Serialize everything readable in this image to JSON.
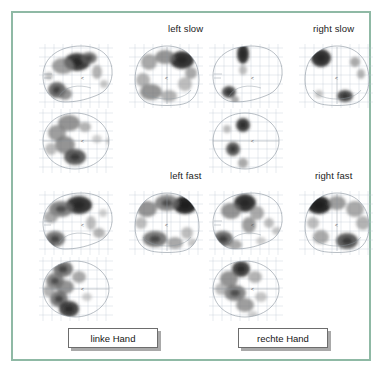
{
  "figure": {
    "border_color": "#8fb9a5",
    "background": "#ffffff",
    "caption_boxes": [
      {
        "name": "linke-hand",
        "label": "linke Hand"
      },
      {
        "name": "rechte-hand",
        "label": "rechte Hand"
      }
    ],
    "panel_titles": [
      {
        "name": "left-slow",
        "label": "left slow"
      },
      {
        "name": "right-slow",
        "label": "right slow"
      },
      {
        "name": "left-fast",
        "label": "left fast"
      },
      {
        "name": "right-fast",
        "label": "right fast"
      }
    ]
  },
  "chart_data": {
    "type": "heatmap",
    "title": "",
    "subtitle": "",
    "xlabel": "",
    "ylabel": "",
    "grid": true,
    "legend_position": "none",
    "colormap": "grayscale-inverted",
    "conditions": [
      {
        "name": "left slow",
        "hand": "linke Hand",
        "views": [
          "sagittal",
          "coronal",
          "transverse"
        ],
        "blob_density": "moderate",
        "peak_intensity": 0.95
      },
      {
        "name": "right slow",
        "hand": "rechte Hand",
        "views": [
          "sagittal",
          "coronal",
          "transverse"
        ],
        "blob_density": "sparse",
        "peak_intensity": 0.9
      },
      {
        "name": "left fast",
        "hand": "linke Hand",
        "views": [
          "sagittal",
          "coronal",
          "transverse"
        ],
        "blob_density": "high",
        "peak_intensity": 1.0
      },
      {
        "name": "right fast",
        "hand": "rechte Hand",
        "views": [
          "sagittal",
          "coronal",
          "transverse"
        ],
        "blob_density": "high",
        "peak_intensity": 1.0
      }
    ],
    "panels": [
      {
        "id": "left-slow-sagittal",
        "condition": "left slow",
        "view": "sagittal",
        "blobs": [
          {
            "cx": 42,
            "cy": 22,
            "rx": 13,
            "ry": 9,
            "i": 0.92
          },
          {
            "cx": 28,
            "cy": 26,
            "rx": 11,
            "ry": 8,
            "i": 0.55
          },
          {
            "cx": 54,
            "cy": 18,
            "rx": 8,
            "ry": 6,
            "i": 0.7
          },
          {
            "cx": 22,
            "cy": 50,
            "rx": 9,
            "ry": 8,
            "i": 0.75
          },
          {
            "cx": 30,
            "cy": 54,
            "rx": 7,
            "ry": 6,
            "i": 0.6
          },
          {
            "cx": 62,
            "cy": 32,
            "rx": 5,
            "ry": 7,
            "i": 0.45
          },
          {
            "cx": 69,
            "cy": 44,
            "rx": 4,
            "ry": 4,
            "i": 0.35
          },
          {
            "cx": 78,
            "cy": 55,
            "rx": 4,
            "ry": 3,
            "i": 0.3
          },
          {
            "cx": 14,
            "cy": 36,
            "rx": 4,
            "ry": 4,
            "i": 0.35
          }
        ]
      },
      {
        "id": "left-slow-coronal",
        "condition": "left slow",
        "view": "coronal",
        "blobs": [
          {
            "cx": 57,
            "cy": 20,
            "rx": 12,
            "ry": 9,
            "i": 0.95
          },
          {
            "cx": 40,
            "cy": 17,
            "rx": 10,
            "ry": 7,
            "i": 0.6
          },
          {
            "cx": 24,
            "cy": 22,
            "rx": 8,
            "ry": 8,
            "i": 0.5
          },
          {
            "cx": 18,
            "cy": 40,
            "rx": 7,
            "ry": 7,
            "i": 0.45
          },
          {
            "cx": 26,
            "cy": 52,
            "rx": 11,
            "ry": 8,
            "i": 0.6
          },
          {
            "cx": 44,
            "cy": 56,
            "rx": 8,
            "ry": 6,
            "i": 0.45
          },
          {
            "cx": 60,
            "cy": 44,
            "rx": 7,
            "ry": 7,
            "i": 0.4
          },
          {
            "cx": 66,
            "cy": 33,
            "rx": 6,
            "ry": 6,
            "i": 0.5
          }
        ]
      },
      {
        "id": "left-slow-transverse",
        "condition": "left slow",
        "view": "transverse",
        "blobs": [
          {
            "cx": 34,
            "cy": 18,
            "rx": 11,
            "ry": 8,
            "i": 0.6
          },
          {
            "cx": 22,
            "cy": 28,
            "rx": 9,
            "ry": 8,
            "i": 0.55
          },
          {
            "cx": 30,
            "cy": 40,
            "rx": 10,
            "ry": 9,
            "i": 0.6
          },
          {
            "cx": 40,
            "cy": 52,
            "rx": 11,
            "ry": 8,
            "i": 0.8
          },
          {
            "cx": 50,
            "cy": 22,
            "rx": 6,
            "ry": 5,
            "i": 0.45
          },
          {
            "cx": 16,
            "cy": 44,
            "rx": 6,
            "ry": 6,
            "i": 0.4
          },
          {
            "cx": 62,
            "cy": 34,
            "rx": 5,
            "ry": 4,
            "i": 0.3
          },
          {
            "cx": 75,
            "cy": 36,
            "rx": 4,
            "ry": 4,
            "i": 0.3
          }
        ]
      },
      {
        "id": "right-slow-sagittal",
        "condition": "right slow",
        "view": "sagittal",
        "blobs": [
          {
            "cx": 38,
            "cy": 14,
            "rx": 6,
            "ry": 10,
            "i": 0.95
          },
          {
            "cx": 38,
            "cy": 30,
            "rx": 4,
            "ry": 5,
            "i": 0.4
          },
          {
            "cx": 24,
            "cy": 52,
            "rx": 7,
            "ry": 6,
            "i": 0.85
          },
          {
            "cx": 30,
            "cy": 60,
            "rx": 4,
            "ry": 4,
            "i": 0.5
          }
        ]
      },
      {
        "id": "right-slow-coronal",
        "condition": "right slow",
        "view": "coronal",
        "blobs": [
          {
            "cx": 26,
            "cy": 18,
            "rx": 10,
            "ry": 9,
            "i": 0.95
          },
          {
            "cx": 60,
            "cy": 22,
            "rx": 5,
            "ry": 5,
            "i": 0.5
          },
          {
            "cx": 66,
            "cy": 34,
            "rx": 4,
            "ry": 5,
            "i": 0.45
          },
          {
            "cx": 50,
            "cy": 56,
            "rx": 8,
            "ry": 6,
            "i": 0.85
          },
          {
            "cx": 24,
            "cy": 54,
            "rx": 4,
            "ry": 4,
            "i": 0.35
          }
        ]
      },
      {
        "id": "right-slow-transverse",
        "condition": "right slow",
        "view": "transverse",
        "blobs": [
          {
            "cx": 38,
            "cy": 20,
            "rx": 7,
            "ry": 7,
            "i": 0.9
          },
          {
            "cx": 22,
            "cy": 24,
            "rx": 4,
            "ry": 4,
            "i": 0.4
          },
          {
            "cx": 28,
            "cy": 44,
            "rx": 7,
            "ry": 7,
            "i": 0.8
          },
          {
            "cx": 38,
            "cy": 58,
            "rx": 5,
            "ry": 5,
            "i": 0.5
          }
        ]
      },
      {
        "id": "left-fast-sagittal",
        "condition": "left fast",
        "view": "sagittal",
        "blobs": [
          {
            "cx": 44,
            "cy": 18,
            "rx": 13,
            "ry": 9,
            "i": 0.95
          },
          {
            "cx": 26,
            "cy": 22,
            "rx": 12,
            "ry": 8,
            "i": 0.65
          },
          {
            "cx": 16,
            "cy": 30,
            "rx": 7,
            "ry": 6,
            "i": 0.5
          },
          {
            "cx": 20,
            "cy": 52,
            "rx": 10,
            "ry": 8,
            "i": 0.7
          },
          {
            "cx": 14,
            "cy": 60,
            "rx": 5,
            "ry": 4,
            "i": 0.8
          },
          {
            "cx": 56,
            "cy": 36,
            "rx": 5,
            "ry": 7,
            "i": 0.4
          },
          {
            "cx": 64,
            "cy": 46,
            "rx": 6,
            "ry": 5,
            "i": 0.45
          },
          {
            "cx": 74,
            "cy": 52,
            "rx": 5,
            "ry": 4,
            "i": 0.4
          },
          {
            "cx": 68,
            "cy": 26,
            "rx": 4,
            "ry": 4,
            "i": 0.3
          }
        ]
      },
      {
        "id": "left-fast-coronal",
        "condition": "left fast",
        "view": "coronal",
        "blobs": [
          {
            "cx": 60,
            "cy": 18,
            "rx": 12,
            "ry": 9,
            "i": 1.0
          },
          {
            "cx": 42,
            "cy": 16,
            "rx": 12,
            "ry": 8,
            "i": 0.65
          },
          {
            "cx": 22,
            "cy": 22,
            "rx": 10,
            "ry": 8,
            "i": 0.6
          },
          {
            "cx": 16,
            "cy": 36,
            "rx": 6,
            "ry": 6,
            "i": 0.4
          },
          {
            "cx": 30,
            "cy": 52,
            "rx": 12,
            "ry": 8,
            "i": 0.7
          },
          {
            "cx": 50,
            "cy": 56,
            "rx": 8,
            "ry": 6,
            "i": 0.5
          },
          {
            "cx": 62,
            "cy": 46,
            "rx": 6,
            "ry": 6,
            "i": 0.4
          },
          {
            "cx": 68,
            "cy": 56,
            "rx": 5,
            "ry": 4,
            "i": 0.35
          }
        ]
      },
      {
        "id": "left-fast-transverse",
        "condition": "left fast",
        "view": "transverse",
        "blobs": [
          {
            "cx": 28,
            "cy": 16,
            "rx": 10,
            "ry": 8,
            "i": 0.7
          },
          {
            "cx": 20,
            "cy": 28,
            "rx": 9,
            "ry": 8,
            "i": 0.65
          },
          {
            "cx": 30,
            "cy": 34,
            "rx": 9,
            "ry": 7,
            "i": 0.6
          },
          {
            "cx": 24,
            "cy": 46,
            "rx": 9,
            "ry": 8,
            "i": 0.7
          },
          {
            "cx": 34,
            "cy": 56,
            "rx": 10,
            "ry": 8,
            "i": 0.9
          },
          {
            "cx": 44,
            "cy": 24,
            "rx": 7,
            "ry": 6,
            "i": 0.5
          },
          {
            "cx": 14,
            "cy": 38,
            "rx": 6,
            "ry": 6,
            "i": 0.45
          },
          {
            "cx": 52,
            "cy": 44,
            "rx": 5,
            "ry": 4,
            "i": 0.3
          }
        ]
      },
      {
        "id": "right-fast-sagittal",
        "condition": "right fast",
        "view": "sagittal",
        "blobs": [
          {
            "cx": 40,
            "cy": 16,
            "rx": 11,
            "ry": 9,
            "i": 0.95
          },
          {
            "cx": 26,
            "cy": 24,
            "rx": 10,
            "ry": 8,
            "i": 0.6
          },
          {
            "cx": 52,
            "cy": 26,
            "rx": 7,
            "ry": 7,
            "i": 0.5
          },
          {
            "cx": 44,
            "cy": 38,
            "rx": 7,
            "ry": 8,
            "i": 0.55
          },
          {
            "cx": 18,
            "cy": 52,
            "rx": 10,
            "ry": 8,
            "i": 0.75
          },
          {
            "cx": 30,
            "cy": 58,
            "rx": 7,
            "ry": 5,
            "i": 0.5
          },
          {
            "cx": 64,
            "cy": 36,
            "rx": 5,
            "ry": 5,
            "i": 0.4
          },
          {
            "cx": 72,
            "cy": 44,
            "rx": 5,
            "ry": 4,
            "i": 0.35
          },
          {
            "cx": 56,
            "cy": 54,
            "rx": 5,
            "ry": 4,
            "i": 0.3
          }
        ]
      },
      {
        "id": "right-fast-coronal",
        "condition": "right fast",
        "view": "coronal",
        "blobs": [
          {
            "cx": 24,
            "cy": 18,
            "rx": 12,
            "ry": 9,
            "i": 1.0
          },
          {
            "cx": 42,
            "cy": 16,
            "rx": 9,
            "ry": 7,
            "i": 0.55
          },
          {
            "cx": 60,
            "cy": 22,
            "rx": 9,
            "ry": 8,
            "i": 0.5
          },
          {
            "cx": 68,
            "cy": 36,
            "rx": 7,
            "ry": 7,
            "i": 0.45
          },
          {
            "cx": 52,
            "cy": 54,
            "rx": 11,
            "ry": 8,
            "i": 0.8
          },
          {
            "cx": 26,
            "cy": 50,
            "rx": 8,
            "ry": 7,
            "i": 0.5
          },
          {
            "cx": 18,
            "cy": 36,
            "rx": 6,
            "ry": 6,
            "i": 0.4
          }
        ]
      },
      {
        "id": "right-fast-transverse",
        "condition": "right fast",
        "view": "transverse",
        "blobs": [
          {
            "cx": 36,
            "cy": 16,
            "rx": 9,
            "ry": 8,
            "i": 0.9
          },
          {
            "cx": 24,
            "cy": 26,
            "rx": 9,
            "ry": 8,
            "i": 0.6
          },
          {
            "cx": 30,
            "cy": 40,
            "rx": 11,
            "ry": 8,
            "i": 0.65
          },
          {
            "cx": 40,
            "cy": 52,
            "rx": 9,
            "ry": 7,
            "i": 0.55
          },
          {
            "cx": 50,
            "cy": 24,
            "rx": 7,
            "ry": 6,
            "i": 0.45
          },
          {
            "cx": 16,
            "cy": 36,
            "rx": 6,
            "ry": 6,
            "i": 0.4
          },
          {
            "cx": 56,
            "cy": 44,
            "rx": 6,
            "ry": 5,
            "i": 0.35
          },
          {
            "cx": 48,
            "cy": 62,
            "rx": 5,
            "ry": 4,
            "i": 0.3
          }
        ]
      }
    ]
  }
}
